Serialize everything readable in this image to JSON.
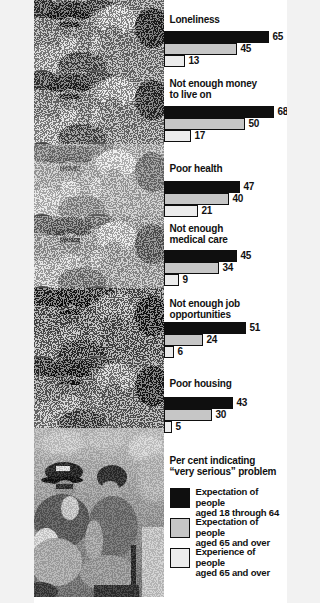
{
  "chart": {
    "scale_px_per_percent": 1.615,
    "groups": [
      {
        "title": "Loneliness",
        "bars": [
          {
            "series": "expectation_18_64",
            "value": 65
          },
          {
            "series": "expectation_65_over",
            "value": 45
          },
          {
            "series": "experience_65_over",
            "value": 13
          }
        ]
      },
      {
        "title": "Not enough money\nto live on",
        "bars": [
          {
            "series": "expectation_18_64",
            "value": 68
          },
          {
            "series": "expectation_65_over",
            "value": 50
          },
          {
            "series": "experience_65_over",
            "value": 17
          }
        ]
      },
      {
        "title": "Poor health",
        "bars": [
          {
            "series": "expectation_18_64",
            "value": 47
          },
          {
            "series": "expectation_65_over",
            "value": 40
          },
          {
            "series": "experience_65_over",
            "value": 21
          }
        ]
      },
      {
        "title": "Not enough\nmedical care",
        "bars": [
          {
            "series": "expectation_18_64",
            "value": 45
          },
          {
            "series": "expectation_65_over",
            "value": 34
          },
          {
            "series": "experience_65_over",
            "value": 9
          }
        ]
      },
      {
        "title": "Not enough job\nopportunities",
        "bars": [
          {
            "series": "expectation_18_64",
            "value": 51
          },
          {
            "series": "expectation_65_over",
            "value": 24
          },
          {
            "series": "experience_65_over",
            "value": 6
          }
        ]
      },
      {
        "title": "Poor housing",
        "bars": [
          {
            "series": "expectation_18_64",
            "value": 43
          },
          {
            "series": "expectation_65_over",
            "value": 30
          },
          {
            "series": "experience_65_over",
            "value": 5
          }
        ]
      }
    ]
  },
  "legend": {
    "heading": "Per cent indicating\n“very serious” problem",
    "items": [
      {
        "label": "Expectation of people\naged 18 through 64",
        "swatch_color": "#0f0f0f"
      },
      {
        "label": "Expectation of people\naged 65 and over",
        "swatch_color": "#c6c6c6"
      },
      {
        "label": "Experience of people\naged 65 and over",
        "swatch_color": "#ececec"
      }
    ]
  },
  "photo": {
    "description": "halftone photo of a crowd of older people, repeated in exposure bands, clear photo of two seated people at bottom"
  },
  "colors": {
    "bar_black": "#0f0f0f",
    "bar_gray": "#c6c6c6",
    "bar_light": "#ececec",
    "outline": "#0f0f0f",
    "background": "#ffffff"
  },
  "chart_data": {
    "type": "bar",
    "orientation": "horizontal",
    "title": "Per cent indicating “very serious” problem",
    "categories": [
      "Loneliness",
      "Not enough money to live on",
      "Poor health",
      "Not enough medical care",
      "Not enough job opportunities",
      "Poor housing"
    ],
    "series": [
      {
        "name": "Expectation of people aged 18 through 64",
        "values": [
          65,
          68,
          47,
          45,
          51,
          43
        ]
      },
      {
        "name": "Expectation of people aged 65 and over",
        "values": [
          45,
          50,
          40,
          34,
          24,
          30
        ]
      },
      {
        "name": "Experience of people aged 65 and over",
        "values": [
          13,
          17,
          21,
          9,
          6,
          5
        ]
      }
    ],
    "xlim": [
      0,
      76
    ],
    "value_labels": true,
    "grid": false,
    "legend_position": "bottom-right"
  }
}
